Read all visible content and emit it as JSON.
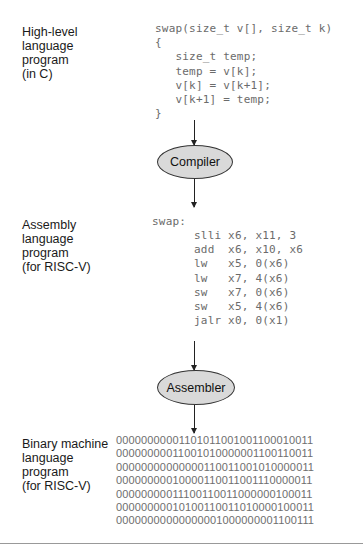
{
  "stages": {
    "high_level": {
      "label": "High-level\nlanguage\nprogram\n(in C)",
      "code": "swap(size_t v[], size_t k)\n{\n   size_t temp;\n   temp = v[k];\n   v[k] = v[k+1];\n   v[k+1] = temp;\n}"
    },
    "compiler": {
      "label": "Compiler"
    },
    "assembly": {
      "label": "Assembly\nlanguage\nprogram\n(for RISC-V)",
      "header": "swap:",
      "code": "slli x6, x11, 3\nadd  x6, x10, x6\nlw   x5, 0(x6)\nlw   x7, 4(x6)\nsw   x7, 0(x6)\nsw   x5, 4(x6)\njalr x0, 0(x1)"
    },
    "assembler": {
      "label": "Assembler"
    },
    "binary": {
      "label": "Binary machine\nlanguage\nprogram\n(for RISC-V)",
      "code": "00000000001101011001001100010011\n00000000011001010000001100110011\n00000000000000110011001010000011\n00000000010000110011001110000011\n00000000011100110011000000100011\n00000000010100110011010000100011\n00000000000000001000000001100111"
    }
  },
  "colors": {
    "ellipse_fill": "#d9d9d9",
    "code_text": "#6b6b6b",
    "label_text": "#1a1a1a"
  }
}
